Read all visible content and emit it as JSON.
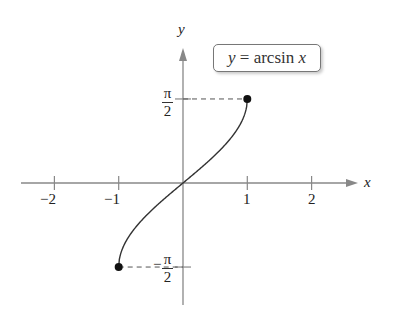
{
  "chart_data": {
    "type": "line",
    "title": "",
    "function_label": {
      "lhs": "y",
      "eq": " = ",
      "fn": "arcsin ",
      "var": "x"
    },
    "xlabel": "x",
    "ylabel": "y",
    "xlim": [
      -2.5,
      2.6
    ],
    "ylim": [
      -1.9,
      2.05
    ],
    "x_ticks": [
      -2,
      -1,
      1,
      2
    ],
    "x_tick_labels": [
      "−2",
      "−1",
      "1",
      "2"
    ],
    "y_ticks": [
      1.5708,
      -1.5708
    ],
    "y_tick_labels": [
      {
        "num": "π",
        "den": "2",
        "sign": ""
      },
      {
        "num": "π",
        "den": "2",
        "sign": "−"
      }
    ],
    "grid": false,
    "series": [
      {
        "name": "y = arcsin x",
        "x": [
          -1,
          -0.99,
          -0.95,
          -0.9,
          -0.8,
          -0.6,
          -0.4,
          -0.2,
          0,
          0.2,
          0.4,
          0.6,
          0.8,
          0.9,
          0.95,
          0.99,
          1
        ],
        "y": [
          -1.5708,
          -1.4293,
          -1.2532,
          -1.1198,
          -0.9273,
          -0.6435,
          -0.4115,
          -0.2014,
          0,
          0.2014,
          0.4115,
          0.6435,
          0.9273,
          1.1198,
          1.2532,
          1.4293,
          1.5708
        ]
      }
    ],
    "endpoints": [
      {
        "x": -1,
        "y": -1.5708
      },
      {
        "x": 1,
        "y": 1.5708
      }
    ],
    "dashed_guides": [
      {
        "from": [
          0,
          1.5708
        ],
        "to": [
          1,
          1.5708
        ]
      },
      {
        "from": [
          -1,
          -1.5708
        ],
        "to": [
          0,
          -1.5708
        ]
      }
    ]
  }
}
